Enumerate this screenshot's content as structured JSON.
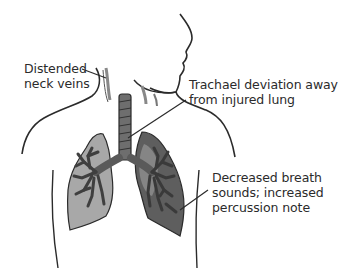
{
  "diagram": {
    "labels": {
      "neck_veins": [
        "Distended",
        "neck veins"
      ],
      "trachea": [
        "Trachael deviation away",
        "from injured lung"
      ],
      "breath": [
        "Decreased breath",
        "sounds; increased",
        "percussion note"
      ]
    },
    "colors": {
      "outline": "#2b2b2b",
      "healthy_lung": "#a8a8a8",
      "injured_lung": "#5e5e5e",
      "airway": "#6e6e6e",
      "background": "#ffffff"
    }
  }
}
